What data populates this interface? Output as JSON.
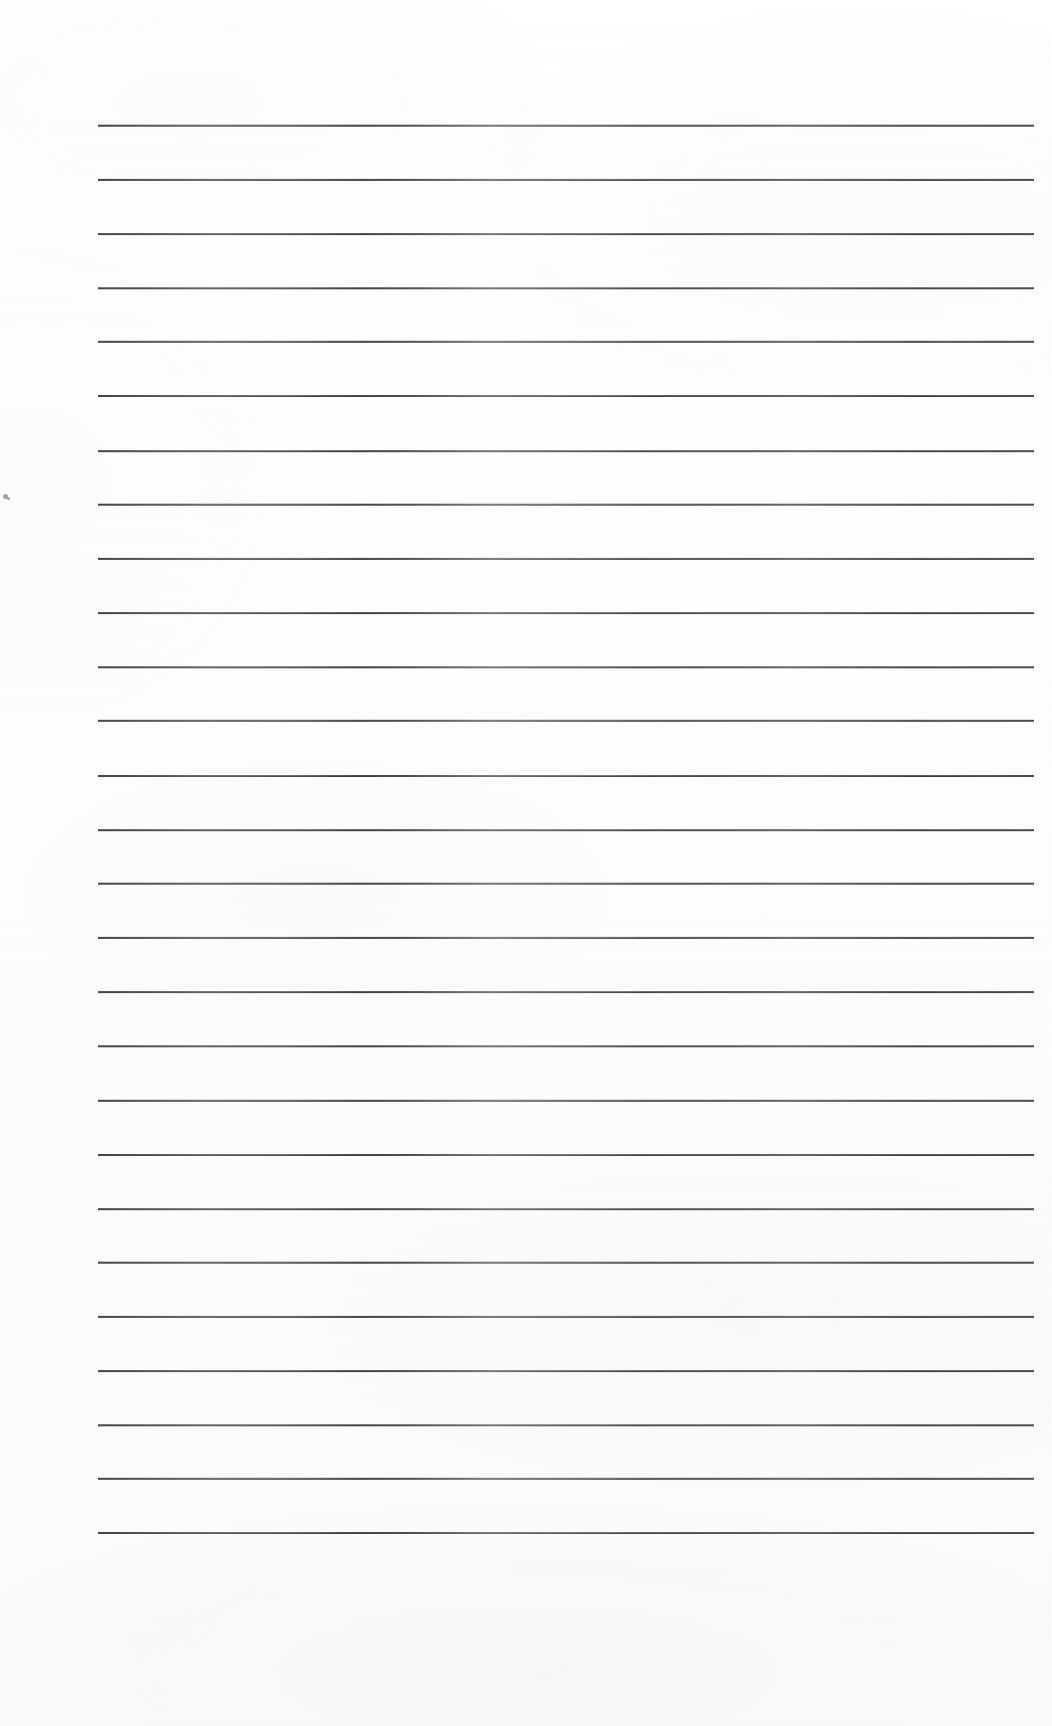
{
  "document": {
    "kind": "scanned-blank-ruled-page",
    "description": "Blank lined notebook page scan with no written content",
    "page_width": 1052,
    "page_height": 1726,
    "background_color": "#ffffff",
    "paper_tint": "#fdfdfd",
    "text_content": "",
    "has_text": false
  },
  "ruling": {
    "line_color": "#3a3a3a",
    "line_thickness_px": 2,
    "line_left_px": 98,
    "line_right_px": 1034,
    "line_width_px": 936,
    "first_line_y_px": 125,
    "line_spacing_px": 54.1,
    "line_count": 27,
    "line_y_positions": [
      125,
      179,
      233,
      287,
      341,
      395,
      450,
      504,
      558,
      612,
      666,
      720,
      775,
      829,
      883,
      937,
      991,
      1045,
      1100,
      1154,
      1208,
      1262,
      1316,
      1370,
      1424,
      1478,
      1532
    ]
  },
  "margins": {
    "top_margin_px": 125,
    "bottom_margin_px": 194,
    "left_margin_px": 98,
    "right_margin_px": 18
  },
  "artifacts": {
    "specks": [
      {
        "x": 3,
        "y": 494,
        "size": 5
      },
      {
        "x": 7,
        "y": 497,
        "size": 3
      }
    ]
  }
}
